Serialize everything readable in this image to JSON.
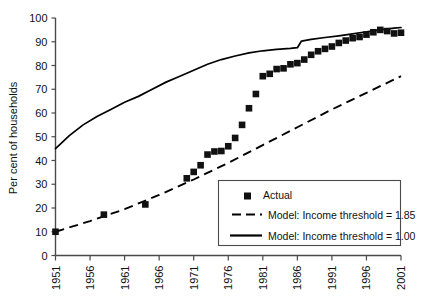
{
  "chart_data": {
    "type": "line",
    "title": "",
    "subtitle": "",
    "xlabel": "",
    "ylabel": "Per cent of households",
    "xlim": [
      1951,
      2001
    ],
    "ylim": [
      0,
      100
    ],
    "grid": false,
    "legend_position": "lower-right-inside",
    "y_ticks": [
      0,
      10,
      20,
      30,
      40,
      50,
      60,
      70,
      80,
      90,
      100
    ],
    "y_tick_labels": [
      "0",
      "10",
      "20",
      "30",
      "40",
      "50",
      "60",
      "70",
      "80",
      "90",
      "100"
    ],
    "x_ticks": [
      1951,
      1956,
      1961,
      1966,
      1971,
      1976,
      1981,
      1986,
      1991,
      1996,
      2001
    ],
    "x_tick_labels": [
      "1951",
      "1956",
      "1961",
      "1966",
      "1971",
      "1976",
      "1981",
      "1986",
      "1991",
      "1996",
      "2001"
    ],
    "series": [
      {
        "name": "Actual",
        "type": "scatter",
        "marker": "square",
        "color": "#111111",
        "points": [
          [
            1951,
            10.0
          ],
          [
            1958,
            17.2
          ],
          [
            1964,
            21.5
          ],
          [
            1970,
            32.5
          ],
          [
            1971,
            35.2
          ],
          [
            1972,
            38.0
          ],
          [
            1973,
            42.5
          ],
          [
            1974,
            43.8
          ],
          [
            1975,
            44.0
          ],
          [
            1976,
            46.0
          ],
          [
            1977,
            49.5
          ],
          [
            1978,
            55.0
          ],
          [
            1979,
            62.0
          ],
          [
            1980,
            68.0
          ],
          [
            1981,
            75.5
          ],
          [
            1982,
            76.5
          ],
          [
            1983,
            78.5
          ],
          [
            1984,
            78.8
          ],
          [
            1985,
            80.5
          ],
          [
            1986,
            81.0
          ],
          [
            1987,
            82.5
          ],
          [
            1988,
            84.5
          ],
          [
            1989,
            86.0
          ],
          [
            1990,
            87.0
          ],
          [
            1991,
            88.0
          ],
          [
            1992,
            89.5
          ],
          [
            1993,
            90.5
          ],
          [
            1994,
            91.5
          ],
          [
            1995,
            92.0
          ],
          [
            1996,
            93.0
          ],
          [
            1997,
            94.0
          ],
          [
            1998,
            95.0
          ],
          [
            1999,
            94.5
          ],
          [
            2000,
            93.5
          ],
          [
            2001,
            93.8
          ]
        ]
      },
      {
        "name": "Model: Income threshold = 1.85",
        "type": "line",
        "style": "dashed",
        "color": "#000000",
        "points": [
          [
            1951,
            10.0
          ],
          [
            1956,
            14.5
          ],
          [
            1961,
            19.5
          ],
          [
            1966,
            25.5
          ],
          [
            1971,
            32.0
          ],
          [
            1976,
            39.0
          ],
          [
            1981,
            46.5
          ],
          [
            1986,
            54.0
          ],
          [
            1991,
            61.5
          ],
          [
            1996,
            68.5
          ],
          [
            2001,
            75.5
          ]
        ]
      },
      {
        "name": "Model: Income threshold = 1.00",
        "type": "line",
        "style": "solid",
        "color": "#000000",
        "points": [
          [
            1951,
            45.0
          ],
          [
            1953,
            50.5
          ],
          [
            1955,
            55.0
          ],
          [
            1957,
            58.5
          ],
          [
            1959,
            61.5
          ],
          [
            1961,
            64.5
          ],
          [
            1963,
            67.0
          ],
          [
            1965,
            70.0
          ],
          [
            1967,
            73.0
          ],
          [
            1969,
            75.5
          ],
          [
            1971,
            78.0
          ],
          [
            1973,
            80.5
          ],
          [
            1975,
            82.5
          ],
          [
            1977,
            84.0
          ],
          [
            1979,
            85.3
          ],
          [
            1981,
            86.2
          ],
          [
            1983,
            86.8
          ],
          [
            1985,
            87.2
          ],
          [
            1986,
            87.5
          ],
          [
            1986.6,
            90.3
          ],
          [
            1988,
            91.0
          ],
          [
            1990,
            91.8
          ],
          [
            1992,
            92.5
          ],
          [
            1994,
            93.3
          ],
          [
            1996,
            94.2
          ],
          [
            1998,
            95.0
          ],
          [
            2000,
            95.7
          ],
          [
            2001,
            96.0
          ]
        ]
      }
    ],
    "legend_entries": [
      {
        "label": "Actual",
        "swatch": "square-marker"
      },
      {
        "label": "Model: Income threshold = 1.85",
        "swatch": "dashed-line"
      },
      {
        "label": "Model: Income threshold = 1.00",
        "swatch": "solid-line"
      }
    ]
  }
}
